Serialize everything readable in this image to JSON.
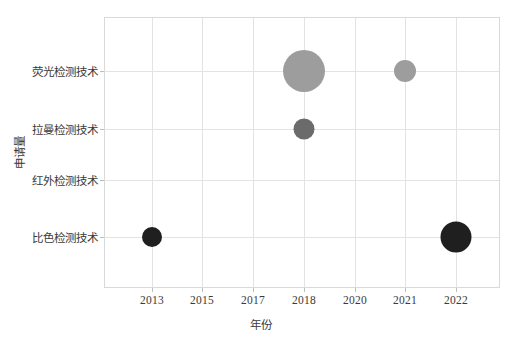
{
  "chart_data": {
    "type": "scatter",
    "title": "",
    "xlabel": "年份",
    "ylabel": "申请量",
    "grid": true,
    "legend": "none",
    "x_tick_labels": [
      "2013",
      "2015",
      "2017",
      "2018",
      "2020",
      "2021",
      "2022"
    ],
    "y_categories": [
      "比色检测技术",
      "红外检测技术",
      "拉曼检测技术",
      "荧光检测技术"
    ],
    "y_tick_labels_top_to_bottom": [
      "荧光检测技术",
      "拉曼检测技术",
      "红外检测技术",
      "比色检测技术"
    ],
    "points": [
      {
        "x": "2013",
        "y": "比色检测技术",
        "size": 10,
        "color": "#1f1f1f"
      },
      {
        "x": "2018",
        "y": "荧光检测技术",
        "size": 21,
        "color": "#9d9d9d"
      },
      {
        "x": "2018",
        "y": "拉曼检测技术",
        "size": 10.5,
        "color": "#6b6b6b"
      },
      {
        "x": "2021",
        "y": "荧光检测技术",
        "size": 11,
        "color": "#9d9d9d"
      },
      {
        "x": "2022",
        "y": "比色检测技术",
        "size": 15.5,
        "color": "#1f1f1f"
      }
    ],
    "colors": {
      "grid": "#e3e3e3",
      "frame": "#d9d9d9",
      "text": "#3a3a3a",
      "bubble_light": "#9d9d9d",
      "bubble_mid": "#6b6b6b",
      "bubble_dark": "#1f1f1f"
    },
    "geometry": {
      "plot": {
        "left": 104,
        "top": 17,
        "width": 396,
        "height": 271
      },
      "x_positions": [
        152,
        202,
        253,
        304,
        355,
        405,
        456
      ],
      "y_positions": [
        71,
        129,
        180,
        237
      ]
    }
  }
}
